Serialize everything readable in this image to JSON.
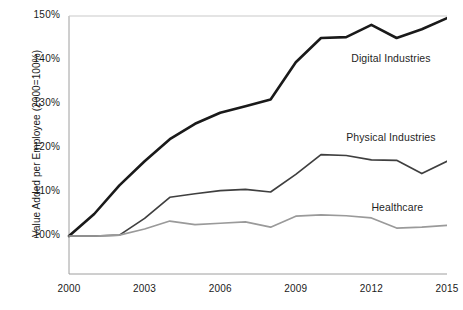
{
  "chart_data": {
    "type": "line",
    "title": "",
    "xlabel": "",
    "ylabel": "Value Added per Employee (2000=100%)",
    "xlim": [
      2000,
      2015
    ],
    "ylim": [
      95,
      150
    ],
    "grid": false,
    "legend_position": "inline-right-of-series",
    "x": [
      2000,
      2001,
      2002,
      2003,
      2004,
      2005,
      2006,
      2007,
      2008,
      2009,
      2010,
      2011,
      2012,
      2013,
      2014,
      2015
    ],
    "xticks": [
      "2000",
      "2003",
      "2006",
      "2009",
      "2012",
      "2015"
    ],
    "xtick_values": [
      2000,
      2003,
      2006,
      2009,
      2012,
      2015
    ],
    "yticks": [
      "100%",
      "110%",
      "120%",
      "130%",
      "140%",
      "150%"
    ],
    "ytick_values": [
      100,
      110,
      120,
      130,
      140,
      150
    ],
    "series": [
      {
        "name": "Digital Industries",
        "color": "#1a1a1a",
        "width": 2.6,
        "values": [
          100.0,
          105.0,
          111.5,
          117.0,
          122.0,
          125.5,
          128.0,
          129.5,
          131.0,
          139.5,
          145.0,
          145.2,
          148.0,
          145.0,
          147.0,
          149.5
        ],
        "label_x": 2011.2,
        "label_y": 140.3
      },
      {
        "name": "Physical Industries",
        "color": "#3f3f3f",
        "width": 1.7,
        "values": [
          100.0,
          100.0,
          100.2,
          104.0,
          108.8,
          109.6,
          110.3,
          110.6,
          110.0,
          114.0,
          118.5,
          118.3,
          117.3,
          117.2,
          114.2,
          117.0
        ],
        "label_x": 2011.0,
        "label_y": 122.2
      },
      {
        "name": "Healthcare",
        "color": "#9a9a9a",
        "width": 1.7,
        "values": [
          100.0,
          100.0,
          100.2,
          101.6,
          103.4,
          102.6,
          102.9,
          103.2,
          102.0,
          104.5,
          104.8,
          104.6,
          104.1,
          101.8,
          102.0,
          102.4
        ],
        "label_x": 2012.0,
        "label_y": 106.4
      }
    ]
  },
  "axis": {
    "y_title": "Value Added per Employee (2000=100%)"
  },
  "colors": {
    "digital": "#1a1a1a",
    "physical": "#3f3f3f",
    "healthcare": "#9a9a9a",
    "axis_line": "#9e9e9e",
    "text": "#1a1a1a",
    "background": "#ffffff"
  }
}
